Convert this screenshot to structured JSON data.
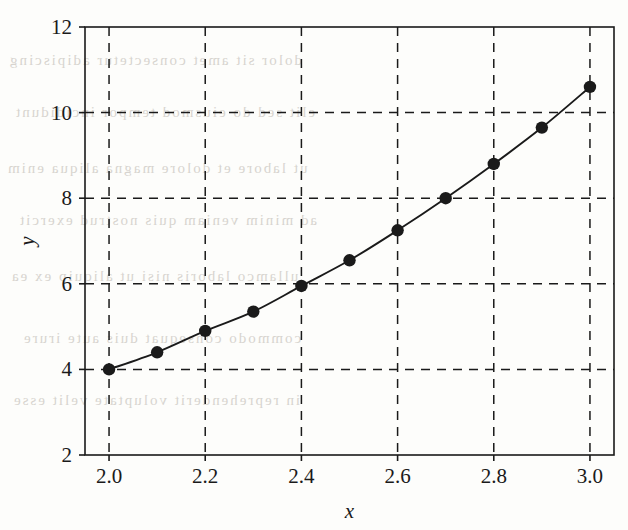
{
  "figure": {
    "background_color": "#fdfdfb",
    "ink_color": "#1a1a1a",
    "bleed_through_color": "#b9b4ac"
  },
  "chart_data": {
    "type": "line",
    "title": "",
    "subtitle": "",
    "xlabel": "x",
    "ylabel": "y",
    "xlim": [
      1.95,
      3.05
    ],
    "ylim": [
      2,
      12
    ],
    "xticks": [
      2.0,
      2.2,
      2.4,
      2.6,
      2.8,
      3.0
    ],
    "xtick_labels": [
      "2.0",
      "2.2",
      "2.4",
      "2.6",
      "2.8",
      "3.0"
    ],
    "yticks": [
      2,
      4,
      6,
      8,
      10,
      12
    ],
    "ytick_labels": [
      "2",
      "4",
      "6",
      "8",
      "10",
      "12"
    ],
    "grid": true,
    "grid_style": "dashed",
    "legend": null,
    "legend_position": "none",
    "marker": "filled-circle",
    "line_style": "solid",
    "line_color": "#1a1a1a",
    "marker_color": "#1a1a1a",
    "x": [
      2.0,
      2.1,
      2.2,
      2.3,
      2.4,
      2.5,
      2.6,
      2.7,
      2.8,
      2.9,
      3.0
    ],
    "values": [
      4.0,
      4.4,
      4.9,
      5.35,
      5.95,
      6.55,
      7.25,
      8.0,
      8.8,
      9.65,
      10.6
    ],
    "series": [
      {
        "name": "",
        "x": [
          2.0,
          2.1,
          2.2,
          2.3,
          2.4,
          2.5,
          2.6,
          2.7,
          2.8,
          2.9,
          3.0
        ],
        "values": [
          4.0,
          4.4,
          4.9,
          5.35,
          5.95,
          6.55,
          7.25,
          8.0,
          8.8,
          9.65,
          10.6
        ]
      }
    ],
    "annotations": []
  },
  "scan_artifacts": {
    "description": "faint mirrored bleed-through text from reverse page",
    "lines": [
      "dolor sit amet consectetur adipiscing",
      "elit sed do eiusmod tempor incididunt",
      "ut labore et dolore magna aliqua enim",
      "ad minim veniam quis nostrud exercit",
      "ullamco laboris nisi ut aliquip ex ea",
      "commodo consequat duis aute irure",
      "in reprehenderit voluptate velit esse"
    ]
  }
}
